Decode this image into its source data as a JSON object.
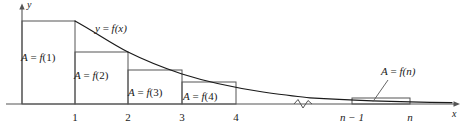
{
  "figure": {
    "kind": "integral-test-rectangles",
    "background_color": "#ffffff",
    "ink_color": "#1a1a1a",
    "curve_color": "#1a1a1a",
    "rect_stroke_color": "#555555",
    "axis_color": "#555555"
  },
  "axes": {
    "y_axis_label": "y",
    "x_axis_label": "x",
    "origin_px": {
      "x": 22,
      "y": 104
    },
    "x_axis_end_px": 460,
    "y_axis_top_px": 6
  },
  "curve": {
    "label": "y = f(x)",
    "label_y": "y",
    "label_eq": "=",
    "label_f": "f",
    "label_arg": "(x)",
    "description": "decreasing positive function"
  },
  "ticks": [
    {
      "label": "1",
      "x_px": 75
    },
    {
      "label": "2",
      "x_px": 128
    },
    {
      "label": "3",
      "x_px": 182
    },
    {
      "label": "4",
      "x_px": 236
    },
    {
      "label": "n − 1",
      "x_px": 352
    },
    {
      "label": "n",
      "x_px": 410
    }
  ],
  "break_mark": {
    "symbol": "squiggle",
    "x_px": 303,
    "y_px": 104
  },
  "rectangles": [
    {
      "label": "A = f(1)",
      "label_A": "A",
      "label_eq": "=",
      "label_f": "f",
      "label_arg": "(1)",
      "x0_px": 22,
      "x1_px": 75,
      "top_px": 21,
      "label_x_px": 21,
      "label_y_px": 52
    },
    {
      "label": "A = f(2)",
      "label_A": "A",
      "label_eq": "=",
      "label_f": "f",
      "label_arg": "(2)",
      "x0_px": 75,
      "x1_px": 128,
      "top_px": 52,
      "label_x_px": 74,
      "label_y_px": 70
    },
    {
      "label": "A = f(3)",
      "label_A": "A",
      "label_eq": "=",
      "label_f": "f",
      "label_arg": "(3)",
      "x0_px": 128,
      "x1_px": 182,
      "top_px": 70,
      "label_x_px": 128,
      "label_y_px": 87
    },
    {
      "label": "A = f(4)",
      "label_A": "A",
      "label_eq": "=",
      "label_f": "f",
      "label_arg": "(4)",
      "x0_px": 182,
      "x1_px": 236,
      "top_px": 82,
      "label_x_px": 183,
      "label_y_px": 91
    },
    {
      "label": "A = f(n)",
      "label_A": "A",
      "label_eq": "=",
      "label_f": "f",
      "label_arg": "(n)",
      "x0_px": 352,
      "x1_px": 410,
      "top_px": 98,
      "label_x_px": 381,
      "label_y_px": 66
    }
  ],
  "leader_line": {
    "from_x_px": 388,
    "from_y_px": 80,
    "to_x_px": 373,
    "to_y_px": 102
  }
}
